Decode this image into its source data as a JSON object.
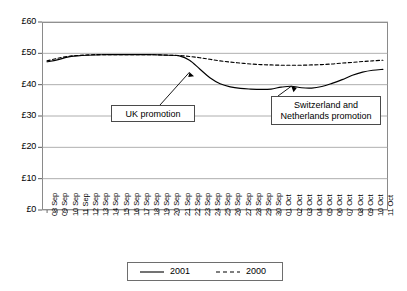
{
  "chart_data": {
    "type": "line",
    "title": "",
    "xlabel": "",
    "ylabel": "",
    "ylim": [
      0,
      60
    ],
    "ytick_labels": [
      "£0",
      "£10",
      "£20",
      "£30",
      "£40",
      "£50",
      "£60"
    ],
    "ytick_values": [
      0,
      10,
      20,
      30,
      40,
      50,
      60
    ],
    "grid": true,
    "legend_position": "bottom",
    "categories": [
      "08 Sep",
      "09 Sep",
      "10 Sep",
      "11 Sep",
      "12 Sep",
      "13 Sep",
      "14 Sep",
      "15 Sep",
      "16 Sep",
      "17 Sep",
      "18 Sep",
      "19 Sep",
      "20 Sep",
      "21 Sep",
      "22 Sep",
      "23 Sep",
      "24 Sep",
      "25 Sep",
      "26 Sep",
      "27 Sep",
      "28 Sep",
      "29 Sep",
      "30 Sep",
      "01 Oct",
      "02 Oct",
      "03 Oct",
      "04 Oct",
      "05 Oct",
      "06 Oct",
      "07 Oct",
      "08 Oct",
      "09 Oct",
      "10 Oct",
      "11 Oct"
    ],
    "series": [
      {
        "name": "2001",
        "style": "solid",
        "color": "#000000",
        "values": [
          47.3,
          47.9,
          48.8,
          49.2,
          49.4,
          49.5,
          49.6,
          49.6,
          49.6,
          49.6,
          49.6,
          49.5,
          49.4,
          49.2,
          47.8,
          45.0,
          42.2,
          40.3,
          39.3,
          38.8,
          38.6,
          38.5,
          38.6,
          39.2,
          39.5,
          39.0,
          38.9,
          39.4,
          40.4,
          41.6,
          43.0,
          44.0,
          44.6,
          44.9
        ]
      },
      {
        "name": "2000",
        "style": "dashed",
        "color": "#000000",
        "values": [
          47.6,
          48.4,
          49.0,
          49.3,
          49.5,
          49.6,
          49.6,
          49.6,
          49.6,
          49.6,
          49.6,
          49.5,
          49.4,
          49.3,
          49.0,
          48.6,
          48.1,
          47.6,
          47.2,
          46.9,
          46.6,
          46.4,
          46.3,
          46.2,
          46.2,
          46.2,
          46.3,
          46.4,
          46.6,
          46.9,
          47.1,
          47.4,
          47.6,
          47.8
        ]
      }
    ],
    "annotations": [
      {
        "id": "uk-promotion",
        "text": "UK promotion",
        "target_category": "22 Sep",
        "target_value": 44.0
      },
      {
        "id": "switzerland-netherlands-promotion",
        "line1": "Switzerland and",
        "line2": "Netherlands promotion",
        "target_category": "02 Oct",
        "target_value": 39.5
      }
    ]
  },
  "legend": {
    "entries": [
      {
        "label": "2001",
        "style": "solid"
      },
      {
        "label": "2000",
        "style": "dashed"
      }
    ]
  }
}
